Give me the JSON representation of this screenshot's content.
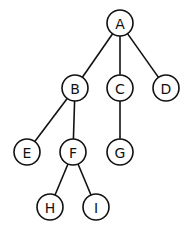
{
  "diagram": {
    "type": "tree",
    "root": "A",
    "nodes": [
      {
        "id": "A",
        "label": "A",
        "x": 120,
        "y": 23
      },
      {
        "id": "B",
        "label": "B",
        "x": 75,
        "y": 88
      },
      {
        "id": "C",
        "label": "C",
        "x": 120,
        "y": 88
      },
      {
        "id": "D",
        "label": "D",
        "x": 166,
        "y": 88
      },
      {
        "id": "E",
        "label": "E",
        "x": 27,
        "y": 152
      },
      {
        "id": "F",
        "label": "F",
        "x": 73,
        "y": 152
      },
      {
        "id": "G",
        "label": "G",
        "x": 120,
        "y": 152
      },
      {
        "id": "H",
        "label": "H",
        "x": 50,
        "y": 207
      },
      {
        "id": "I",
        "label": "I",
        "x": 96,
        "y": 207
      }
    ],
    "edges": [
      {
        "from": "A",
        "to": "B"
      },
      {
        "from": "A",
        "to": "C"
      },
      {
        "from": "A",
        "to": "D"
      },
      {
        "from": "B",
        "to": "E"
      },
      {
        "from": "B",
        "to": "F"
      },
      {
        "from": "C",
        "to": "G"
      },
      {
        "from": "F",
        "to": "H"
      },
      {
        "from": "F",
        "to": "I"
      }
    ],
    "node_radius": 13,
    "colors": {
      "stroke": "#111111",
      "fill": "#ffffff"
    }
  }
}
